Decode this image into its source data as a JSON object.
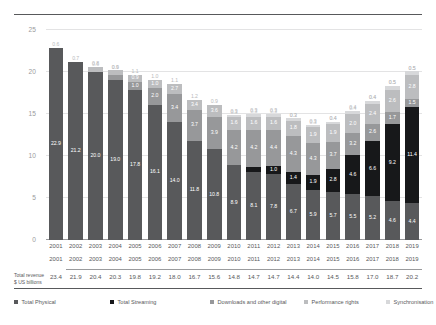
{
  "chart_data": {
    "type": "bar",
    "subtype": "stacked-column",
    "title": "",
    "xlabel": "",
    "ylabel": "",
    "ylim": [
      0,
      25
    ],
    "yticks": [
      "0",
      "5",
      "10",
      "15",
      "20",
      "25"
    ],
    "grid": true,
    "legend_position": "bottom",
    "categories": [
      "2001",
      "2002",
      "2003",
      "2004",
      "2005",
      "2006",
      "2007",
      "2008",
      "2009",
      "2010",
      "2011",
      "2012",
      "2013",
      "2014",
      "2015",
      "2016",
      "2017",
      "2018",
      "2019"
    ],
    "series": [
      {
        "name": "Total Physical",
        "color": "#58595b",
        "values": [
          22.9,
          21.2,
          20.0,
          19.0,
          17.8,
          16.1,
          14.0,
          11.8,
          10.8,
          8.9,
          8.1,
          7.8,
          6.7,
          5.9,
          5.7,
          5.5,
          5.2,
          4.6,
          4.4
        ]
      },
      {
        "name": "Total Streaming",
        "color": "#17181a",
        "values": [
          0,
          0,
          0,
          0,
          0,
          0,
          0,
          0,
          0,
          0.0,
          0.6,
          1.0,
          1.4,
          1.9,
          2.8,
          4.6,
          6.6,
          9.2,
          11.4
        ]
      },
      {
        "name": "Downloads and other digital",
        "color": "#97989a",
        "values": [
          0,
          0,
          0,
          0.6,
          1.0,
          2.0,
          3.4,
          3.7,
          3.9,
          4.2,
          4.4,
          4.3,
          4.3,
          3.7,
          3.2,
          2.6,
          2.0,
          1.5,
          1.0
        ]
      },
      {
        "name": "Performance rights",
        "color": "#bcbdbf",
        "values": [
          0,
          0,
          0.6,
          0.6,
          0.9,
          1.0,
          1.2,
          1.2,
          1.4,
          1.6,
          1.6,
          1.6,
          1.8,
          1.9,
          2.1,
          2.3,
          2.4,
          2.6,
          2.8
        ]
      },
      {
        "name": "Synchronisation",
        "color": "#d7d8da",
        "values": [
          0,
          0,
          0,
          0,
          0,
          0,
          0,
          0,
          0,
          0.2,
          0.3,
          0.3,
          0.3,
          0.3,
          0.3,
          0.4,
          0.4,
          0.5,
          0.5
        ]
      }
    ],
    "segment_labels": [
      {
        "year": "2001",
        "labels": {
          "physical": "22.9",
          "streaming": "",
          "downloads": "",
          "performance": "",
          "sync": "",
          "top": "0.6"
        }
      },
      {
        "year": "2002",
        "labels": {
          "physical": "21.2",
          "streaming": "",
          "downloads": "",
          "performance": "",
          "sync": "",
          "top": "0.7"
        }
      },
      {
        "year": "2003",
        "labels": {
          "physical": "20.0",
          "streaming": "",
          "downloads": "",
          "performance": "0.6",
          "sync": "",
          "top": "0.8"
        }
      },
      {
        "year": "2004",
        "labels": {
          "physical": "19.0",
          "streaming": "",
          "downloads": "0.6",
          "performance": "0.6",
          "sync": "",
          "top": "0.9"
        }
      },
      {
        "year": "2005",
        "labels": {
          "physical": "17.8",
          "streaming": "",
          "downloads": "1.0",
          "performance": "0.9",
          "sync": "",
          "top": "1.1"
        }
      },
      {
        "year": "2006",
        "labels": {
          "physical": "16.1",
          "streaming": "",
          "downloads": "2.0",
          "performance": "1.0",
          "sync": "",
          "top": "1.0"
        }
      },
      {
        "year": "2007",
        "labels": {
          "physical": "14.0",
          "streaming": "",
          "downloads": "3.4",
          "performance": "2.7",
          "sync": "",
          "top": "1.1"
        }
      },
      {
        "year": "2008",
        "labels": {
          "physical": "11.8",
          "streaming": "",
          "downloads": "3.7",
          "performance": "3.4",
          "sync": "",
          "top": "1.2"
        }
      },
      {
        "year": "2009",
        "labels": {
          "physical": "10.8",
          "streaming": "",
          "downloads": "3.9",
          "performance": "3.6",
          "sync": "",
          "top": "0.9"
        }
      },
      {
        "year": "2010",
        "labels": {
          "physical": "8.9",
          "streaming": "",
          "downloads": "4.2",
          "performance": "1.6",
          "sync": "0.3",
          "top": "0.3"
        }
      },
      {
        "year": "2011",
        "labels": {
          "physical": "8.1",
          "streaming": "0.6",
          "downloads": "4.2",
          "performance": "1.6",
          "sync": "0.3",
          "top": "0.3"
        }
      },
      {
        "year": "2012",
        "labels": {
          "physical": "7.8",
          "streaming": "1.0",
          "downloads": "4.4",
          "performance": "1.6",
          "sync": "0.3",
          "top": "0.3"
        }
      },
      {
        "year": "2013",
        "labels": {
          "physical": "6.7",
          "streaming": "1.4",
          "downloads": "4.3",
          "performance": "1.8",
          "sync": "0.3",
          "top": "0.3"
        }
      },
      {
        "year": "2014",
        "labels": {
          "physical": "5.9",
          "streaming": "1.9",
          "downloads": "4.3",
          "performance": "1.9",
          "sync": "0.3",
          "top": "0.3"
        }
      },
      {
        "year": "2015",
        "labels": {
          "physical": "5.7",
          "streaming": "2.8",
          "downloads": "3.7",
          "performance": "1.9",
          "sync": "0.4",
          "top": "0.4"
        }
      },
      {
        "year": "2016",
        "labels": {
          "physical": "5.5",
          "streaming": "4.6",
          "downloads": "3.2",
          "performance": "2.0",
          "sync": "0.4",
          "top": "0.4"
        }
      },
      {
        "year": "2017",
        "labels": {
          "physical": "5.2",
          "streaming": "6.6",
          "downloads": "2.6",
          "performance": "2.4",
          "sync": "0.4",
          "top": "0.4"
        }
      },
      {
        "year": "2018",
        "labels": {
          "physical": "4.6",
          "streaming": "9.2",
          "downloads": "1.7",
          "performance": "2.6",
          "sync": "0.5",
          "top": "0.5"
        }
      },
      {
        "year": "2019",
        "labels": {
          "physical": "4.4",
          "streaming": "11.4",
          "downloads": "1.5",
          "performance": "2.8",
          "sync": "0.5",
          "top": "0.5"
        }
      }
    ],
    "totals": {
      "label_line1": "Total revenue",
      "label_line2": "$ US billions",
      "values": [
        "23.4",
        "21.9",
        "20.4",
        "20.3",
        "19.8",
        "19.2",
        "18.0",
        "16.7",
        "15.6",
        "14.8",
        "14.7",
        "14.7",
        "14.4",
        "14.0",
        "14.5",
        "15.8",
        "17.0",
        "18.7",
        "20.2"
      ]
    },
    "legend": [
      {
        "label": "Total Physical",
        "color": "#58595b"
      },
      {
        "label": "Total Streaming",
        "color": "#17181a"
      },
      {
        "label": "Downloads and other digital",
        "color": "#97989a"
      },
      {
        "label": "Performance rights",
        "color": "#bcbdbf"
      },
      {
        "label": "Synchronisation",
        "color": "#d7d8da"
      }
    ]
  }
}
